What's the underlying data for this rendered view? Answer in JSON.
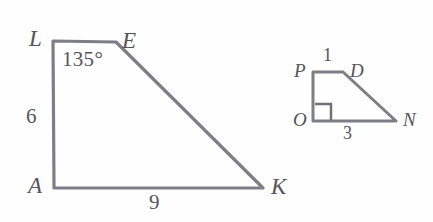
{
  "figure": {
    "kind": "geometry-diagram",
    "background_color": "#fefefe",
    "stroke_color": "#7e7e86",
    "text_color": "#55555b",
    "shapes": [
      {
        "name": "trapezoid-leka",
        "vertices": [
          {
            "label": "L",
            "x": 53,
            "y": 41
          },
          {
            "label": "E",
            "x": 116,
            "y": 42
          },
          {
            "label": "K",
            "x": 263,
            "y": 188
          },
          {
            "label": "A",
            "x": 54,
            "y": 188
          }
        ],
        "vertex_labels": [
          {
            "id": "L",
            "text": "L",
            "x": 29,
            "y": 27
          },
          {
            "id": "E",
            "text": "E",
            "x": 122,
            "y": 29
          },
          {
            "id": "K",
            "text": "K",
            "x": 271,
            "y": 175
          },
          {
            "id": "A",
            "text": "A",
            "x": 28,
            "y": 174
          }
        ],
        "measures": [
          {
            "id": "side-la",
            "text": "6",
            "x": 26,
            "y": 106
          },
          {
            "id": "side-ak",
            "text": "9",
            "x": 149,
            "y": 192
          }
        ],
        "angles": [
          {
            "id": "angle-e",
            "text": "135°",
            "x": 62,
            "y": 49
          }
        ]
      },
      {
        "name": "trapezoid-pdno",
        "vertices": [
          {
            "label": "P",
            "x": 313,
            "y": 72
          },
          {
            "label": "D",
            "x": 343,
            "y": 72
          },
          {
            "label": "N",
            "x": 396,
            "y": 121
          },
          {
            "label": "O",
            "x": 313,
            "y": 121
          }
        ],
        "vertex_labels": [
          {
            "id": "P",
            "text": "P",
            "x": 294,
            "y": 61
          },
          {
            "id": "D",
            "text": "D",
            "x": 350,
            "y": 61
          },
          {
            "id": "N",
            "text": "N",
            "x": 403,
            "y": 110
          },
          {
            "id": "O",
            "text": "O",
            "x": 293,
            "y": 110
          }
        ],
        "measures": [
          {
            "id": "side-pd",
            "text": "1",
            "x": 323,
            "y": 46
          },
          {
            "id": "side-on",
            "text": "3",
            "x": 343,
            "y": 124
          }
        ],
        "right_angle_marker": {
          "id": "right-angle-o",
          "x": 315,
          "y": 104,
          "size": 16
        }
      }
    ]
  }
}
